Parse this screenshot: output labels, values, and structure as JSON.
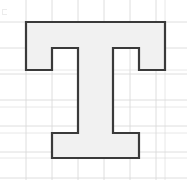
{
  "figure": {
    "title": "",
    "shape_name": "letter-t-polygon",
    "background_color": "#ffffff",
    "fill_color": "#f1f1f1",
    "stroke_color": "#3a3a3a",
    "stroke_width": 2.2,
    "grid": {
      "visible": true,
      "line_color": "#d8d8d8",
      "line_width": 1,
      "cell_size": 26,
      "x_lines": [
        26,
        52,
        78,
        104,
        130,
        156
      ],
      "y_lines": [
        22,
        48,
        74,
        100,
        126,
        152,
        178
      ],
      "extra_x_lines": [
        165
      ],
      "extra_y_lines": [
        70,
        107,
        133,
        158
      ]
    },
    "polygon": {
      "closed": true,
      "points": [
        [
          26,
          22
        ],
        [
          165,
          22
        ],
        [
          165,
          70
        ],
        [
          139,
          70
        ],
        [
          139,
          48
        ],
        [
          113,
          48
        ],
        [
          113,
          133
        ],
        [
          139,
          133
        ],
        [
          139,
          158
        ],
        [
          52,
          158
        ],
        [
          52,
          133
        ],
        [
          78,
          133
        ],
        [
          78,
          48
        ],
        [
          52,
          48
        ],
        [
          52,
          70
        ],
        [
          26,
          70
        ]
      ]
    },
    "corner_mark": {
      "visible": true,
      "label": "",
      "color": "#9a9a9a"
    }
  }
}
